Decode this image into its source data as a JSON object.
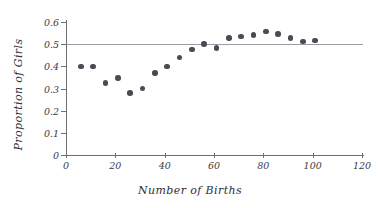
{
  "chart_data": {
    "type": "scatter",
    "title": "",
    "xlabel": "Number of Births",
    "ylabel": "Proportion of Girls",
    "xlim": [
      0,
      120
    ],
    "ylim": [
      0,
      0.6
    ],
    "xticks": [
      0,
      20,
      40,
      60,
      80,
      100,
      120
    ],
    "xtick_labels": [
      "0",
      "20",
      "40",
      "60",
      "80",
      "100",
      "120"
    ],
    "yticks": [
      0,
      0.1,
      0.2,
      0.3,
      0.4,
      0.5,
      0.6
    ],
    "ytick_labels": [
      "0",
      "0.1",
      "0.2",
      "0.3",
      "0.4",
      "0.5",
      "0.6"
    ],
    "grid": false,
    "legend": "none",
    "marker_color": "#4a4a52",
    "reference_line": {
      "orientation": "horizontal",
      "value": 0.5,
      "color": "#9b9ba3",
      "label": ""
    },
    "x": [
      6,
      11,
      16,
      21,
      26,
      31,
      36,
      41,
      46,
      51,
      56,
      61,
      66,
      71,
      76,
      81,
      86,
      91,
      96,
      101
    ],
    "y": [
      0.4,
      0.4,
      0.325,
      0.348,
      0.28,
      0.299,
      0.37,
      0.399,
      0.44,
      0.475,
      0.5,
      0.482,
      0.528,
      0.534,
      0.542,
      0.558,
      0.546,
      0.528,
      0.512,
      0.516
    ],
    "points": [
      {
        "x": 6,
        "y": 0.4
      },
      {
        "x": 11,
        "y": 0.4
      },
      {
        "x": 16,
        "y": 0.325
      },
      {
        "x": 21,
        "y": 0.348
      },
      {
        "x": 26,
        "y": 0.28
      },
      {
        "x": 31,
        "y": 0.299
      },
      {
        "x": 36,
        "y": 0.37
      },
      {
        "x": 41,
        "y": 0.399
      },
      {
        "x": 46,
        "y": 0.44
      },
      {
        "x": 51,
        "y": 0.475
      },
      {
        "x": 56,
        "y": 0.5
      },
      {
        "x": 61,
        "y": 0.482
      },
      {
        "x": 66,
        "y": 0.528
      },
      {
        "x": 71,
        "y": 0.534
      },
      {
        "x": 76,
        "y": 0.542
      },
      {
        "x": 81,
        "y": 0.558
      },
      {
        "x": 86,
        "y": 0.546
      },
      {
        "x": 91,
        "y": 0.528
      },
      {
        "x": 96,
        "y": 0.512
      },
      {
        "x": 101,
        "y": 0.516
      }
    ]
  }
}
